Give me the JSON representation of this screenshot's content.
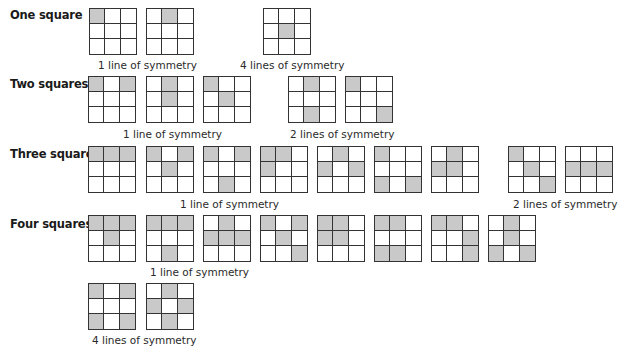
{
  "colors": {
    "shaded": "#c9c9c9",
    "line": "#333333",
    "background": "#ffffff"
  },
  "rows": [
    {
      "label": "One square",
      "label_y": 8,
      "groups": [
        {
          "caption": "1 line of symmetry",
          "caption_x": 98,
          "caption_y": 59,
          "grids": [
            {
              "x": 89,
              "y": 8,
              "shaded": [
                [
                  0,
                  0
                ]
              ]
            },
            {
              "x": 146,
              "y": 8,
              "shaded": [
                [
                  0,
                  1
                ]
              ]
            }
          ]
        },
        {
          "caption": "4 lines of symmetry",
          "caption_x": 240,
          "caption_y": 59,
          "grids": [
            {
              "x": 263,
              "y": 8,
              "shaded": [
                [
                  1,
                  1
                ]
              ]
            }
          ]
        }
      ]
    },
    {
      "label": "Two squares",
      "label_y": 77,
      "groups": [
        {
          "caption": "1 line of symmetry",
          "caption_x": 123,
          "caption_y": 128,
          "grids": [
            {
              "x": 88,
              "y": 76,
              "shaded": [
                [
                  0,
                  0
                ],
                [
                  0,
                  2
                ]
              ]
            },
            {
              "x": 146,
              "y": 76,
              "shaded": [
                [
                  0,
                  1
                ],
                [
                  1,
                  1
                ]
              ]
            },
            {
              "x": 203,
              "y": 76,
              "shaded": [
                [
                  0,
                  0
                ],
                [
                  1,
                  1
                ]
              ]
            }
          ]
        },
        {
          "caption": "2 lines of symmetry",
          "caption_x": 290,
          "caption_y": 128,
          "grids": [
            {
              "x": 288,
              "y": 76,
              "shaded": [
                [
                  0,
                  1
                ],
                [
                  2,
                  1
                ]
              ]
            },
            {
              "x": 345,
              "y": 76,
              "shaded": [
                [
                  0,
                  0
                ],
                [
                  2,
                  2
                ]
              ]
            }
          ]
        }
      ]
    },
    {
      "label": "Three squares",
      "label_y": 147,
      "groups": [
        {
          "caption": "1 line of symmetry",
          "caption_x": 180,
          "caption_y": 198,
          "grids": [
            {
              "x": 88,
              "y": 146,
              "shaded": [
                [
                  0,
                  0
                ],
                [
                  0,
                  1
                ],
                [
                  0,
                  2
                ]
              ]
            },
            {
              "x": 146,
              "y": 146,
              "shaded": [
                [
                  0,
                  0
                ],
                [
                  0,
                  2
                ],
                [
                  1,
                  1
                ]
              ]
            },
            {
              "x": 203,
              "y": 146,
              "shaded": [
                [
                  0,
                  0
                ],
                [
                  0,
                  2
                ],
                [
                  2,
                  1
                ]
              ]
            },
            {
              "x": 260,
              "y": 146,
              "shaded": [
                [
                  0,
                  0
                ],
                [
                  0,
                  1
                ],
                [
                  1,
                  0
                ]
              ]
            },
            {
              "x": 317,
              "y": 146,
              "shaded": [
                [
                  0,
                  1
                ],
                [
                  1,
                  0
                ],
                [
                  1,
                  2
                ]
              ]
            },
            {
              "x": 374,
              "y": 146,
              "shaded": [
                [
                  0,
                  0
                ],
                [
                  2,
                  0
                ],
                [
                  2,
                  2
                ]
              ]
            },
            {
              "x": 431,
              "y": 146,
              "shaded": [
                [
                  0,
                  1
                ],
                [
                  1,
                  0
                ],
                [
                  1,
                  1
                ]
              ]
            }
          ]
        },
        {
          "caption": "2 lines of symmetry",
          "caption_x": 513,
          "caption_y": 198,
          "grids": [
            {
              "x": 508,
              "y": 146,
              "shaded": [
                [
                  0,
                  0
                ],
                [
                  1,
                  1
                ],
                [
                  2,
                  2
                ]
              ]
            },
            {
              "x": 565,
              "y": 146,
              "shaded": [
                [
                  1,
                  0
                ],
                [
                  1,
                  1
                ],
                [
                  1,
                  2
                ]
              ]
            }
          ]
        }
      ]
    },
    {
      "label": "Four squares",
      "label_y": 217,
      "groups": [
        {
          "caption": "1 line of symmetry",
          "caption_x": 150,
          "caption_y": 266,
          "grids": [
            {
              "x": 88,
              "y": 215,
              "shaded": [
                [
                  0,
                  0
                ],
                [
                  0,
                  1
                ],
                [
                  0,
                  2
                ],
                [
                  1,
                  1
                ]
              ]
            },
            {
              "x": 146,
              "y": 215,
              "shaded": [
                [
                  0,
                  0
                ],
                [
                  0,
                  1
                ],
                [
                  0,
                  2
                ],
                [
                  2,
                  1
                ]
              ]
            },
            {
              "x": 203,
              "y": 215,
              "shaded": [
                [
                  0,
                  1
                ],
                [
                  1,
                  0
                ],
                [
                  1,
                  1
                ],
                [
                  1,
                  2
                ]
              ]
            },
            {
              "x": 260,
              "y": 215,
              "shaded": [
                [
                  0,
                  0
                ],
                [
                  0,
                  2
                ],
                [
                  1,
                  1
                ],
                [
                  2,
                  2
                ]
              ]
            },
            {
              "x": 317,
              "y": 215,
              "shaded": [
                [
                  0,
                  0
                ],
                [
                  0,
                  1
                ],
                [
                  1,
                  0
                ],
                [
                  1,
                  1
                ]
              ]
            },
            {
              "x": 374,
              "y": 215,
              "shaded": [
                [
                  0,
                  0
                ],
                [
                  0,
                  1
                ],
                [
                  2,
                  0
                ],
                [
                  2,
                  1
                ]
              ]
            },
            {
              "x": 431,
              "y": 215,
              "shaded": [
                [
                  0,
                  0
                ],
                [
                  0,
                  1
                ],
                [
                  1,
                  2
                ],
                [
                  2,
                  2
                ]
              ]
            },
            {
              "x": 488,
              "y": 215,
              "shaded": [
                [
                  0,
                  1
                ],
                [
                  1,
                  1
                ],
                [
                  2,
                  0
                ],
                [
                  2,
                  2
                ]
              ]
            }
          ]
        },
        {
          "caption": "4 lines of symmetry",
          "caption_x": 92,
          "caption_y": 334,
          "grids": [
            {
              "x": 88,
              "y": 283,
              "shaded": [
                [
                  0,
                  0
                ],
                [
                  0,
                  2
                ],
                [
                  2,
                  0
                ],
                [
                  2,
                  2
                ]
              ]
            },
            {
              "x": 146,
              "y": 283,
              "shaded": [
                [
                  0,
                  1
                ],
                [
                  1,
                  0
                ],
                [
                  1,
                  2
                ],
                [
                  2,
                  1
                ]
              ]
            }
          ]
        }
      ]
    }
  ]
}
